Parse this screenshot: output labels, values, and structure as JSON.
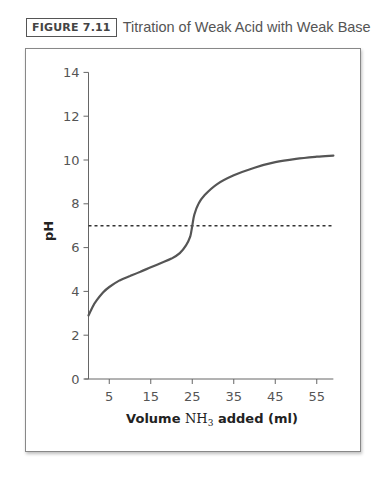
{
  "caption": {
    "badge": "FIGURE 7.11",
    "title": "Titration of Weak Acid with Weak Base"
  },
  "chart_data": {
    "type": "line",
    "title": "Titration of Weak Acid with Weak Base",
    "xlabel_prefix": "Volume ",
    "xlabel_formula": "NH",
    "xlabel_subscript": "3",
    "xlabel_suffix": " added (ml)",
    "xlabel": "Volume NH3 added (ml)",
    "ylabel": "pH",
    "xlim": [
      0,
      59
    ],
    "ylim": [
      0,
      14
    ],
    "xticks": [
      5,
      15,
      25,
      35,
      45,
      55
    ],
    "yticks": [
      0,
      2,
      4,
      6,
      8,
      10,
      12,
      14
    ],
    "grid": false,
    "reference_line": {
      "y": 7,
      "style": "dotted",
      "label": "neutral pH"
    },
    "series": [
      {
        "name": "pH curve",
        "x": [
          0,
          1,
          2,
          3.5,
          5,
          7.5,
          10,
          12.5,
          15,
          17.5,
          20,
          22,
          23.5,
          24.5,
          25,
          25.5,
          26.5,
          28,
          31,
          35,
          40,
          45,
          50,
          55,
          59
        ],
        "y": [
          2.9,
          3.3,
          3.6,
          3.95,
          4.2,
          4.5,
          4.7,
          4.9,
          5.1,
          5.3,
          5.5,
          5.75,
          6.1,
          6.5,
          7.0,
          7.5,
          8.0,
          8.4,
          8.9,
          9.3,
          9.65,
          9.9,
          10.05,
          10.15,
          10.2
        ]
      }
    ]
  }
}
